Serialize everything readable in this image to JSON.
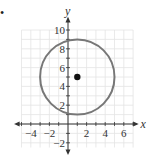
{
  "chart_data": {
    "type": "scatter",
    "title": "",
    "xlabel": "x",
    "ylabel": "y",
    "xlim": [
      -5,
      7.5
    ],
    "ylim": [
      -3,
      11
    ],
    "grid": true,
    "x_ticks": [
      -4,
      -2,
      2,
      4,
      6
    ],
    "y_ticks": [
      -2,
      2,
      4,
      6,
      8,
      10
    ],
    "shapes": [
      {
        "type": "circle",
        "center": [
          1,
          5
        ],
        "radius": 4,
        "color": "#777777"
      }
    ],
    "points": [
      {
        "x": 1,
        "y": 5,
        "label": "center",
        "color": "#111111"
      }
    ]
  },
  "bullet": "•",
  "axes": {
    "x_label": "x",
    "y_label": "y"
  },
  "tick_labels": {
    "x": [
      "−4",
      "−2",
      "2",
      "4",
      "6"
    ],
    "y": [
      "10",
      "8",
      "6",
      "4",
      "2",
      "−2"
    ]
  }
}
